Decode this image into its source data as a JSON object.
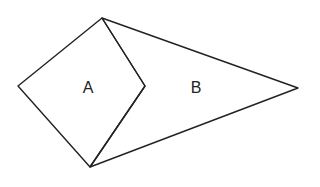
{
  "diagram": {
    "type": "geometric-figure",
    "stroke_color": "#222222",
    "background_color": "#ffffff",
    "vertices": {
      "top": [
        102,
        18
      ],
      "left": [
        18,
        86
      ],
      "right_a": [
        145,
        86
      ],
      "bottom": [
        90,
        167
      ],
      "tip_b": [
        298,
        88
      ]
    },
    "regions": [
      {
        "id": "A",
        "label": "A",
        "shape": "quadrilateral",
        "vertices": [
          "top",
          "left",
          "bottom",
          "right_a"
        ],
        "label_position": [
          88,
          87
        ]
      },
      {
        "id": "B",
        "label": "B",
        "shape": "quadrilateral",
        "vertices": [
          "top",
          "right_a",
          "bottom",
          "tip_b"
        ],
        "label_position": [
          196,
          87
        ]
      }
    ]
  }
}
